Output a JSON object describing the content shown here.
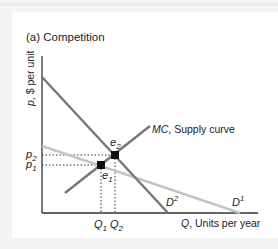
{
  "title": "(a) Competition",
  "axes": {
    "y_label_var": "p",
    "y_label_rest": ", $ per unit",
    "x_label_var": "Q",
    "x_label_rest": ", Units per year"
  },
  "curves": {
    "mc_var": "MC",
    "mc_rest": ", Supply curve",
    "d1_base": "D",
    "d1_sup": "1",
    "d2_base": "D",
    "d2_sup": "2"
  },
  "points": {
    "e1_base": "e",
    "e1_sub": "1",
    "e2_base": "e",
    "e2_sub": "2"
  },
  "ticks": {
    "p1_base": "p",
    "p1_sub": "1",
    "p2_base": "p",
    "p2_sub": "2",
    "q1_base": "Q",
    "q1_sub": "1",
    "q2_base": "Q",
    "q2_sub": "2"
  },
  "colors": {
    "axis": "#333333",
    "d2": "#777777",
    "mc": "#777777",
    "d1": "#c4c4c4",
    "point": "#111111"
  }
}
